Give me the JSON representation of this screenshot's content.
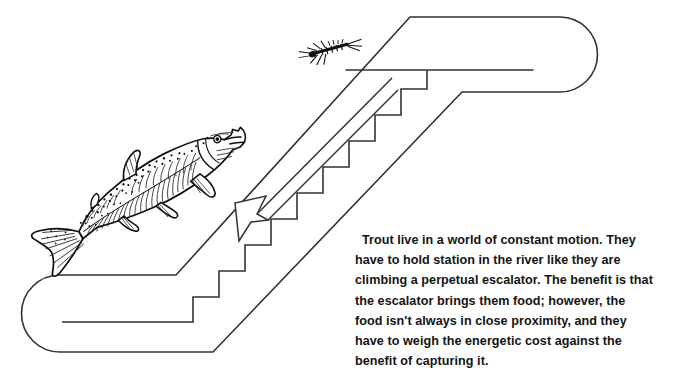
{
  "figure": {
    "caption_text": "Trout live in a world of constant motion. They have to hold station in the river like they are climbing a perpetual escalator. The benefit is that the escalator brings them food; however, the food isn't always in close proximity, and they have to weigh the energetic cost against the benefit of capturing it.",
    "caption_lines": [
      "Trout live in a world of constant motion. They have",
      "to hold station in the river like they are climbing a",
      "perpetual escalator. The benefit is that the escalator",
      "brings them food; however, the food isn't always in",
      "close proximity, and they have to weigh the energetic",
      "cost against the benefit of capturing it."
    ]
  },
  "colors": {
    "background": "#ffffff",
    "ink": "#1a1a1a",
    "line": "#333333",
    "text": "#141414"
  },
  "elements": {
    "escalator_label": "escalator",
    "handrail_label": "handrail belt loop",
    "steps_label": "escalator steps",
    "arrow_label": "downward current direction arrow",
    "fish_label": "trout",
    "insect_label": "aquatic insect (mayfly nymph)"
  },
  "diagram": {
    "step_count": 11,
    "arrow_direction": "down-left",
    "fish_orientation": "head up-right, tail down-left",
    "insect_position": "above escalator, left of handrail"
  }
}
